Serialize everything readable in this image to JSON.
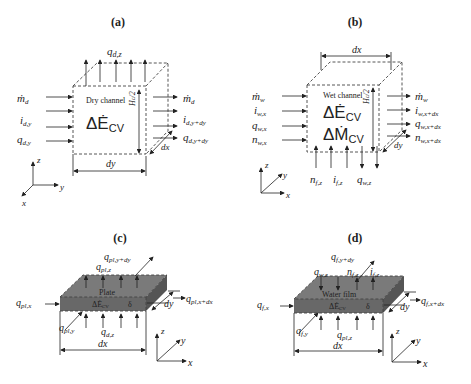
{
  "panels": {
    "a": {
      "label": "(a)",
      "channel": "Dry channel",
      "energy": "ΔĖ",
      "energy_sub": "CV",
      "top_flux": "q",
      "top_flux_sub": "d,z",
      "inlets": [
        {
          "base": "ṁ",
          "sub": "d"
        },
        {
          "base": "i",
          "sub": "d,y"
        },
        {
          "base": "q",
          "sub": "d,y"
        }
      ],
      "outlets": [
        {
          "base": "ṁ",
          "sub": "d"
        },
        {
          "base": "i",
          "sub": "d,y+dy"
        },
        {
          "base": "q",
          "sub": "d,y+dy"
        }
      ],
      "height": "H",
      "height_sub": "c",
      "height_frac": "/2",
      "dim_bottom": "dy",
      "dim_depth": "dx",
      "axes": {
        "up": "z",
        "right": "y",
        "diag": "x"
      }
    },
    "b": {
      "label": "(b)",
      "channel": "Wet channel",
      "energy": "ΔĖ",
      "energy_sub": "CV",
      "mass": "ΔṀ",
      "mass_sub": "CV",
      "inlets": [
        {
          "base": "ṁ",
          "sub": "w"
        },
        {
          "base": "i",
          "sub": "w,x"
        },
        {
          "base": "q",
          "sub": "w,x"
        },
        {
          "base": "n",
          "sub": "w,x"
        }
      ],
      "outlets": [
        {
          "base": "ṁ",
          "sub": "w"
        },
        {
          "base": "i",
          "sub": "w,x+dx"
        },
        {
          "base": "q",
          "sub": "w,x+dx"
        },
        {
          "base": "n",
          "sub": "w,x+dx"
        }
      ],
      "bottom_fluxes": [
        {
          "base": "n",
          "sub": "f,z"
        },
        {
          "base": "i",
          "sub": "f,z"
        },
        {
          "base": "q",
          "sub": "w,z"
        }
      ],
      "height": "H",
      "height_sub": "c",
      "height_frac": "/2",
      "dim_top": "dx",
      "dim_depth": "dy",
      "axes": {
        "up": "z",
        "right": "x",
        "diag": "y"
      }
    },
    "c": {
      "label": "(c)",
      "body": "Plate",
      "energy": "ΔĖ",
      "energy_sub": "CV",
      "thickness": "δ",
      "fluxes": {
        "y_out": {
          "base": "q",
          "sub": "pl,y+dy"
        },
        "z_top": {
          "base": "q",
          "sub": "pl,z"
        },
        "x_in": {
          "base": "q",
          "sub": "pl,x"
        },
        "x_out": {
          "base": "q",
          "sub": "pl,x+dx"
        },
        "y_in": {
          "base": "q",
          "sub": "pl,y"
        },
        "z_bottom": {
          "base": "q",
          "sub": "d,z"
        }
      },
      "dim_bottom": "dx",
      "dim_depth": "dy",
      "axes": {
        "up": "z",
        "right": "x",
        "diag": "y"
      }
    },
    "d": {
      "label": "(d)",
      "body": "Water film",
      "energy": "ΔĖ",
      "energy_sub": "CV",
      "thickness": "δ",
      "fluxes": {
        "y_out": {
          "base": "q",
          "sub": "f,y+dy"
        },
        "z_top_in": {
          "base": "q",
          "sub": "w,z"
        },
        "n_top": {
          "base": "n",
          "sub": "f,z"
        },
        "i_top": {
          "base": "i",
          "sub": "f,z"
        },
        "x_in": {
          "base": "q",
          "sub": "f,x"
        },
        "x_out": {
          "base": "q",
          "sub": "f,x+dx"
        },
        "y_in": {
          "base": "q",
          "sub": "f,y"
        },
        "z_bottom": {
          "base": "q",
          "sub": "pl,z"
        }
      },
      "dim_bottom": "dx",
      "dim_depth": "dy",
      "axes": {
        "up": "z",
        "right": "x",
        "diag": "y"
      }
    }
  },
  "colors": {
    "plate_top": "#7a7a7a",
    "plate_front": "#6a6a6a",
    "plate_side": "#5a5a5a",
    "line": "#222222"
  }
}
